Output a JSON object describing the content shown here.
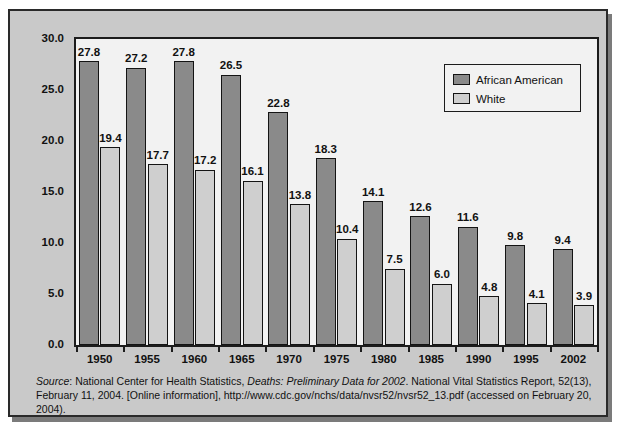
{
  "figure": {
    "y_axis_title": "Deaths per 1,000 births",
    "frame_color": "#c9c9c9",
    "plot_bg_color": "#f2f2f2"
  },
  "legend": {
    "position": "top-right-inside",
    "entries": [
      {
        "label": "African American",
        "color": "#8a8a8a"
      },
      {
        "label": "White",
        "color": "#cfcfcf"
      }
    ]
  },
  "source": {
    "prefix_label": "Source",
    "colon": ": ",
    "agency": "National Center for Health Statistics, ",
    "report_title_italic": "Deaths: Preliminary Data for 2002",
    "rest_line1": ". National Vital Statistics Report, 52(13),",
    "line2": "February 11, 2004. [Online information], http://www.cdc.gov/nchs/data/nvsr52/nvsr52_13.pdf (accessed on",
    "line3": "February 20, 2004)."
  },
  "chart_data": {
    "type": "bar",
    "title": "",
    "xlabel": "",
    "ylabel": "Deaths per 1,000 births",
    "ylim": [
      0.0,
      30.0
    ],
    "yticks": [
      "0.0",
      "5.0",
      "10.0",
      "15.0",
      "20.0",
      "25.0",
      "30.0"
    ],
    "ytick_values": [
      0.0,
      5.0,
      10.0,
      15.0,
      20.0,
      25.0,
      30.0
    ],
    "grid": false,
    "legend_position": "upper right",
    "categories": [
      "1950",
      "1955",
      "1960",
      "1965",
      "1970",
      "1975",
      "1980",
      "1985",
      "1990",
      "1995",
      "2002"
    ],
    "series": [
      {
        "name": "African American",
        "color": "#8a8a8a",
        "values": [
          27.8,
          27.2,
          27.8,
          26.5,
          22.8,
          18.3,
          14.1,
          12.6,
          11.6,
          9.8,
          9.4
        ],
        "labels": [
          "27.8",
          "27.2",
          "27.8",
          "26.5",
          "22.8",
          "18.3",
          "14.1",
          "12.6",
          "11.6",
          "9.8",
          "9.4"
        ]
      },
      {
        "name": "White",
        "color": "#cfcfcf",
        "values": [
          19.4,
          17.7,
          17.2,
          16.1,
          13.8,
          10.4,
          7.5,
          6.0,
          4.8,
          4.1,
          3.9
        ],
        "labels": [
          "19.4",
          "17.7",
          "17.2",
          "16.1",
          "13.8",
          "10.4",
          "7.5",
          "6.0",
          "4.8",
          "4.1",
          "3.9"
        ]
      }
    ]
  }
}
